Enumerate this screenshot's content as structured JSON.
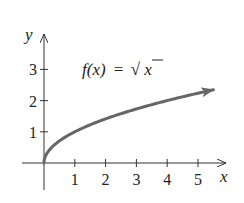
{
  "chart_data": {
    "type": "line",
    "title": "",
    "function_label": "f(x) = √x",
    "function_label_parts": {
      "lhs": "f(x)",
      "eq": "=",
      "rad": "√",
      "arg": "x"
    },
    "xlabel": "x",
    "ylabel": "y",
    "xticks": [
      1,
      2,
      3,
      4,
      5
    ],
    "yticks": [
      1,
      2,
      3
    ],
    "xlim": [
      0,
      5.5
    ],
    "ylim": [
      0,
      3.5
    ],
    "grid": false,
    "legend": "none",
    "series": [
      {
        "name": "f(x) = √x",
        "color": "#666666",
        "end_arrow": true,
        "x": [
          0,
          0.05,
          0.25,
          0.5,
          1,
          1.5,
          2,
          2.5,
          3,
          3.5,
          4,
          4.5,
          5,
          5.5
        ],
        "values": [
          0,
          0.22,
          0.5,
          0.71,
          1,
          1.22,
          1.41,
          1.58,
          1.73,
          1.87,
          2,
          2.12,
          2.24,
          2.35
        ]
      }
    ]
  },
  "colors": {
    "axis": "#333333",
    "curve": "#666666",
    "text": "#222222"
  }
}
